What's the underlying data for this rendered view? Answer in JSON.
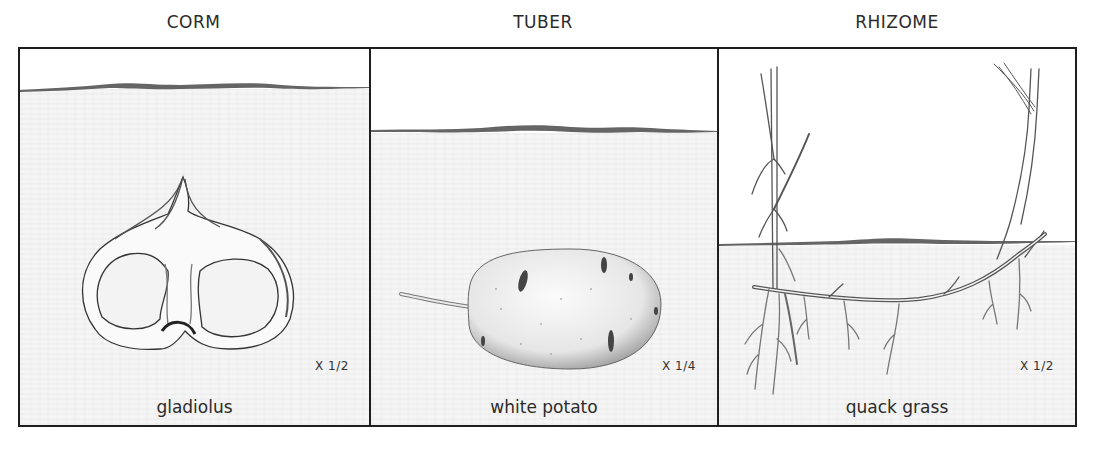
{
  "panels": [
    {
      "title": "CORM",
      "plant_name": "gladiolus",
      "scale": "X 1/2",
      "illustration": "gladiolus-corm-cross-section"
    },
    {
      "title": "TUBER",
      "plant_name": "white potato",
      "scale": "X 1/4",
      "illustration": "white-potato-tuber"
    },
    {
      "title": "RHIZOME",
      "plant_name": "quack grass",
      "scale": "X 1/2",
      "illustration": "quack-grass-rhizome"
    }
  ],
  "colors": {
    "border": "#1e1e1e",
    "soil": "#f5f5f5",
    "ground_line": "#4a4a4a",
    "text": "#2b2b2b"
  }
}
